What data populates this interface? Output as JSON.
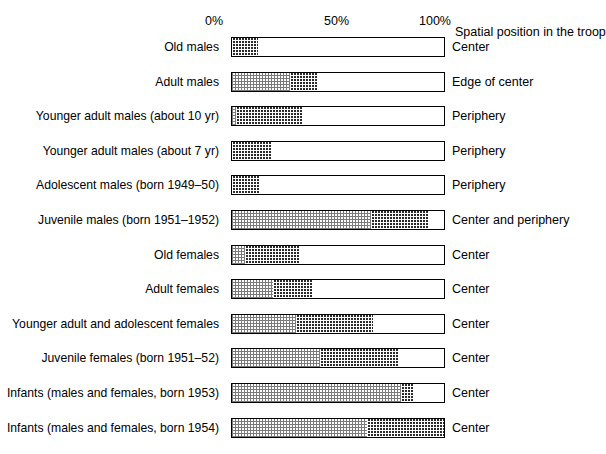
{
  "chart_data": {
    "type": "bar",
    "orientation": "horizontal",
    "stacked": true,
    "title": "",
    "xlabel": "",
    "ylabel": "",
    "xlim": [
      0,
      100
    ],
    "grid": false,
    "legend_position": "none",
    "axis_ticks": [
      {
        "label": "0%",
        "value": 0
      },
      {
        "label": "50%",
        "value": 50
      },
      {
        "label": "100%",
        "value": 100
      }
    ],
    "right_header": "Spatial position in the troop",
    "series": [
      {
        "name": "light-stipple",
        "fill": "fill-light"
      },
      {
        "name": "dark-stipple",
        "fill": "fill-dark"
      },
      {
        "name": "white",
        "fill": "fill-white"
      }
    ],
    "categories": [
      "Old males",
      "Adult males",
      "Younger adult males (about 10 yr)",
      "Younger adult males (about 7 yr)",
      "Adolescent males (born 1949–50)",
      "Juvenile males (born 1951–1952)",
      "Old females",
      "Adult females",
      "Younger adult and adolescent females",
      "Juvenile females (born 1951–52)",
      "Infants (males and females, born 1953)",
      "Infants (males and females, born 1954)"
    ],
    "rows": [
      {
        "label": "Old males",
        "position": "Center",
        "segments": [
          {
            "fill": "fill-dark",
            "start": 0,
            "end": 12
          },
          {
            "fill": "fill-white",
            "start": 12,
            "end": 100
          }
        ]
      },
      {
        "label": "Adult males",
        "position": "Edge of center",
        "segments": [
          {
            "fill": "fill-light",
            "start": 0,
            "end": 27
          },
          {
            "fill": "fill-dark",
            "start": 27,
            "end": 40
          },
          {
            "fill": "fill-white",
            "start": 40,
            "end": 100
          }
        ]
      },
      {
        "label": "Younger adult males (about 10 yr)",
        "position": "Periphery",
        "segments": [
          {
            "fill": "fill-light",
            "start": 0,
            "end": 2
          },
          {
            "fill": "fill-dark",
            "start": 2,
            "end": 33
          },
          {
            "fill": "fill-white",
            "start": 33,
            "end": 100
          }
        ]
      },
      {
        "label": "Younger adult males (about 7 yr)",
        "position": "Periphery",
        "segments": [
          {
            "fill": "fill-dark",
            "start": 0,
            "end": 18
          },
          {
            "fill": "fill-white",
            "start": 18,
            "end": 100
          }
        ]
      },
      {
        "label": "Adolescent males (born 1949–50)",
        "position": "Periphery",
        "segments": [
          {
            "fill": "fill-dark",
            "start": 0,
            "end": 13
          },
          {
            "fill": "fill-white",
            "start": 13,
            "end": 100
          }
        ]
      },
      {
        "label": "Juvenile males (born 1951–1952)",
        "position": "Center and periphery",
        "segments": [
          {
            "fill": "fill-light",
            "start": 0,
            "end": 65
          },
          {
            "fill": "fill-dark",
            "start": 65,
            "end": 92
          },
          {
            "fill": "fill-white",
            "start": 92,
            "end": 100
          }
        ]
      },
      {
        "label": "Old females",
        "position": "Center",
        "segments": [
          {
            "fill": "fill-light",
            "start": 0,
            "end": 6
          },
          {
            "fill": "fill-dark",
            "start": 6,
            "end": 32
          },
          {
            "fill": "fill-white",
            "start": 32,
            "end": 100
          }
        ]
      },
      {
        "label": "Adult females",
        "position": "Center",
        "segments": [
          {
            "fill": "fill-light",
            "start": 0,
            "end": 19
          },
          {
            "fill": "fill-dark",
            "start": 19,
            "end": 38
          },
          {
            "fill": "fill-white",
            "start": 38,
            "end": 100
          }
        ]
      },
      {
        "label": "Younger adult and adolescent females",
        "position": "Center",
        "segments": [
          {
            "fill": "fill-light",
            "start": 0,
            "end": 30
          },
          {
            "fill": "fill-dark",
            "start": 30,
            "end": 66
          },
          {
            "fill": "fill-white",
            "start": 66,
            "end": 100
          }
        ]
      },
      {
        "label": "Juvenile females (born 1951–52)",
        "position": "Center",
        "segments": [
          {
            "fill": "fill-light",
            "start": 0,
            "end": 41
          },
          {
            "fill": "fill-dark",
            "start": 41,
            "end": 78
          },
          {
            "fill": "fill-white",
            "start": 78,
            "end": 100
          }
        ]
      },
      {
        "label": "Infants (males and females, born 1953)",
        "position": "Center",
        "segments": [
          {
            "fill": "fill-light",
            "start": 0,
            "end": 79
          },
          {
            "fill": "fill-dark",
            "start": 79,
            "end": 85
          },
          {
            "fill": "fill-white",
            "start": 85,
            "end": 100
          }
        ]
      },
      {
        "label": "Infants (males and females, born 1954)",
        "position": "Center",
        "segments": [
          {
            "fill": "fill-light",
            "start": 0,
            "end": 63
          },
          {
            "fill": "fill-dark",
            "start": 63,
            "end": 100
          }
        ]
      }
    ]
  }
}
